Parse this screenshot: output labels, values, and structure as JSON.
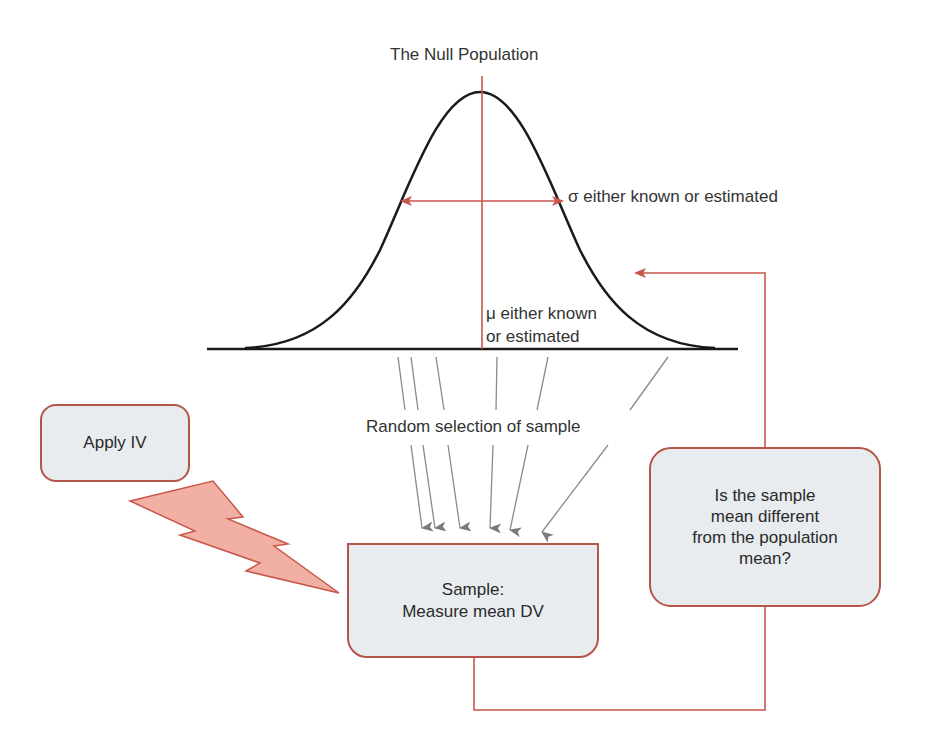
{
  "title": "The Null Population",
  "sigma_label": "σ either known or estimated",
  "mu_label": {
    "line1": "μ either known",
    "line2": "or estimated"
  },
  "random_selection_label": "Random selection of sample",
  "boxes": {
    "apply_iv": "Apply IV",
    "sample": {
      "line1": "Sample:",
      "line2": "Measure mean DV"
    },
    "question": {
      "line1": "Is the sample",
      "line2": "mean different",
      "line3": "from the population",
      "line4": "mean?"
    }
  },
  "colors": {
    "accent": "#c8574a",
    "curve": "#1a1a1a",
    "box_fill": "#e8ecef",
    "box_border": "#b5554a",
    "bolt_fill": "#f2b0a4",
    "arrow_gray": "#7a7a7a"
  }
}
